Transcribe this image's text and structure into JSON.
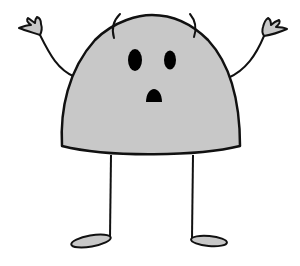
{
  "figure": {
    "colors": {
      "background": "#ffffff",
      "outline": "#111111",
      "fill": "#c8c8c8",
      "features": "#000000"
    },
    "parts": {
      "body": "dome-shaped body",
      "eyes": [
        "left eye",
        "right eye"
      ],
      "mouth": "open mouth",
      "antennae": [
        "left antenna",
        "right antenna"
      ],
      "arms": [
        "left arm raised",
        "right arm raised"
      ],
      "hands": [
        "left hand",
        "right hand"
      ],
      "legs": [
        "left leg",
        "right leg"
      ],
      "feet": [
        "left foot",
        "right foot"
      ]
    }
  }
}
